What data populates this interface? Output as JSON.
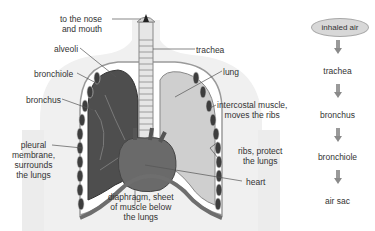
{
  "diagram": {
    "labels": {
      "nose_mouth": "to the nose\nand mouth",
      "alveoli": "alveoli",
      "bronchiole": "bronchiole",
      "bronchus": "bronchus",
      "pleural": "pleural\nmembrane,\nsurrounds\nthe lungs",
      "trachea": "trachea",
      "lung": "lung",
      "intercostal": "intercostal muscle,\nmoves the ribs",
      "ribs": "ribs, protect\nthe lungs",
      "heart": "heart",
      "diaphragm": "diaphragm, sheet\nof muscle below\nthe lungs"
    },
    "colors": {
      "body_silhouette": "#f0f0f0",
      "lung_dark": "#555555",
      "lung_light": "#cfcfcf",
      "heart": "#6a6a6a",
      "diaphragm": "#6e6e6e",
      "ribs": "#4a4a4a"
    }
  },
  "flowchart": {
    "start": "inhaled air",
    "steps": [
      "trachea",
      "bronchus",
      "bronchiole",
      "air sac"
    ],
    "oval_fill": "#d8d8d8",
    "arrow_color": "#9a9a9a"
  }
}
